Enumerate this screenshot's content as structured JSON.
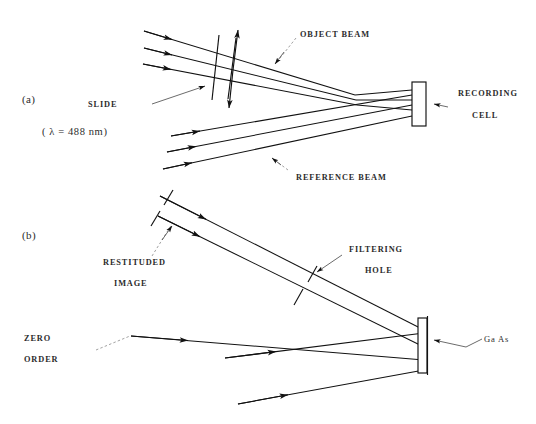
{
  "figure": {
    "background_color": "#ffffff",
    "ink_color": "#111111"
  },
  "panels": [
    {
      "id": "a",
      "label": "(a)",
      "caption_note": "( λ  =  488  nm)",
      "wavelength_value": "488",
      "wavelength_unit": "nm",
      "wavelength_symbol": "λ"
    },
    {
      "id": "b",
      "label": "(b)"
    }
  ],
  "labels": {
    "panel_a": "(a)",
    "panel_b": "(b)",
    "wavelength": "(  λ  =  488  nm)",
    "slide": "SLIDE",
    "object_beam": "OBJECT  BEAM",
    "reference_beam": "REFERENCE  BEAM",
    "recording_cell_line1": "RECORDING",
    "recording_cell_line2": "CELL",
    "restituted_image_line1": "RESTITUDED",
    "restituted_image_line2": "IMAGE",
    "filtering_hole_line1": "FILTERING",
    "filtering_hole_line2": "HOLE",
    "zero_order_line1": "ZERO",
    "zero_order_line2": "ORDER",
    "ga_as": "Ga  As"
  },
  "components": {
    "slide": {
      "name": "slide",
      "panel": "a",
      "kind": "transmission-slide",
      "has_double_arrow": true
    },
    "recording_cell": {
      "name": "recording-cell",
      "panel": "a",
      "kind": "rectangular-cell"
    },
    "filtering_hole": {
      "name": "filtering-hole",
      "panel": "b",
      "kind": "aperture-slit"
    },
    "restituted_image_aperture": {
      "name": "restituted-image-aperture",
      "panel": "b",
      "kind": "aperture-slit"
    },
    "ga_as_cell": {
      "name": "ga-as-cell",
      "panel": "b",
      "kind": "crystal-slab",
      "material": "Ga As"
    }
  },
  "beams": {
    "object_beam_rays": 3,
    "reference_beam_rays": 3,
    "restituted_image_rays": 2,
    "zero_order_rays": 3
  }
}
